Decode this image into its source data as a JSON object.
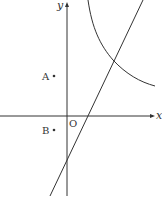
{
  "diagram": {
    "type": "coordinate-plane",
    "axes": {
      "x_label": "x",
      "y_label": "y",
      "origin_label": "O"
    },
    "points": [
      {
        "label": "A",
        "quadrant": "II"
      },
      {
        "label": "B",
        "quadrant": "III"
      }
    ],
    "curves": [
      {
        "kind": "hyperbola-branch",
        "quadrant": "I"
      },
      {
        "kind": "line",
        "slope_sign": "positive",
        "y_intercept_sign": "negative"
      }
    ],
    "colors": {
      "stroke": "#333333",
      "background": "#ffffff"
    }
  }
}
